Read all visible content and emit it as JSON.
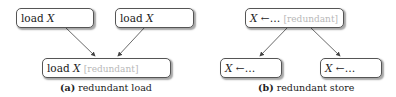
{
  "panel_a": {
    "top_left": {
      "op": "load",
      "var": "X"
    },
    "top_right": {
      "op": "load",
      "var": "X"
    },
    "bottom": {
      "op": "load",
      "var": "X",
      "note": "[redundant]"
    },
    "caption_label": "(a)",
    "caption_text": "redundant load"
  },
  "panel_b": {
    "top": {
      "var": "X",
      "op": "←…",
      "note": "[redundant]"
    },
    "bottom_left": {
      "var": "X",
      "op": "←…"
    },
    "bottom_right": {
      "var": "X",
      "op": "←…"
    },
    "caption_label": "(b)",
    "caption_text": "redundant store"
  },
  "colors": {
    "border": "#555555",
    "faded_text": "#b8b8b8",
    "arrow": "#444444"
  }
}
